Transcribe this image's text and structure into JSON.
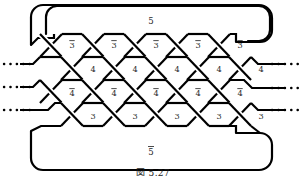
{
  "figure": {
    "type": "braid-closure-knot-diagram",
    "stroke_color": "#000000",
    "label_color": "#2b2b2b",
    "background": "#ffffff",
    "width": 306,
    "height": 176
  },
  "closures": {
    "top_label": "5",
    "top_label_overline": false,
    "bottom_label": "5",
    "bottom_label_overline": true
  },
  "rows": [
    {
      "id": "row-1",
      "label": "3",
      "overline": true,
      "count": 5,
      "labels": [
        "3",
        "3",
        "3",
        "3",
        "3"
      ]
    },
    {
      "id": "row-2",
      "label": "4",
      "overline": false,
      "count": 5,
      "labels": [
        "4",
        "4",
        "4",
        "4",
        "4"
      ]
    },
    {
      "id": "row-3",
      "label": "4",
      "overline": true,
      "count": 5,
      "labels": [
        "4",
        "4",
        "4",
        "4",
        "4"
      ]
    },
    {
      "id": "row-4",
      "label": "3",
      "overline": false,
      "count": 5,
      "labels": [
        "3",
        "3",
        "3",
        "3",
        "3"
      ]
    }
  ],
  "dotted_lines": {
    "left_count": 3,
    "right_count": 3
  },
  "caption": {
    "text": "図 5.27"
  }
}
